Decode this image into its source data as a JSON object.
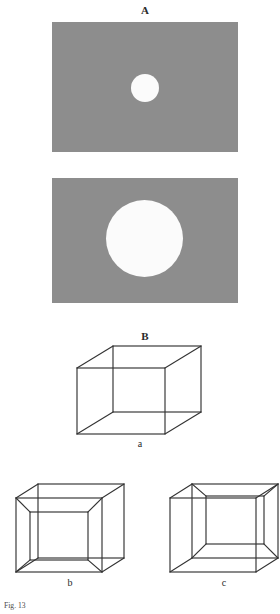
{
  "figure": {
    "part_a": {
      "label": "A",
      "panel_color": "#8d8d8d",
      "disc_color": "#fbfbfb",
      "panels": [
        {
          "name": "small-circle-panel",
          "disc_size": "small"
        },
        {
          "name": "large-circle-panel",
          "disc_size": "large"
        }
      ]
    },
    "part_b": {
      "label": "B",
      "line_color": "#333333",
      "cubes": [
        {
          "caption": "a",
          "variant": "neutral-necker-cube"
        },
        {
          "caption": "b",
          "variant": "inner-square-lower-left"
        },
        {
          "caption": "c",
          "variant": "inner-square-upper-right"
        }
      ]
    },
    "caption": "Fig. 13"
  }
}
